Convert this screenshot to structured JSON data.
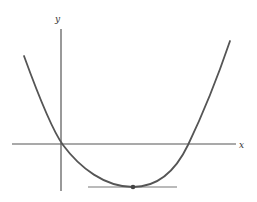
{
  "figure": {
    "axes": {
      "x_label": "x",
      "y_label": "y"
    },
    "curve": {
      "type": "parabola",
      "opens": "up",
      "crosses_y_axis": "slightly above origin",
      "x_intercepts": 2
    },
    "minimum_point": {
      "marker": "dot",
      "tangent_line": "horizontal"
    },
    "colors": {
      "axis": "#555555",
      "curve": "#555555",
      "tangent": "#777777",
      "background": "#ffffff"
    }
  }
}
